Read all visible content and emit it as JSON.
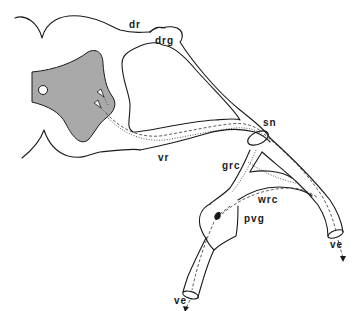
{
  "diagram": {
    "type": "anatomical-schematic",
    "colors": {
      "line": "#1a1a1a",
      "gray_matter": "#a9a9a9",
      "background": "#ffffff"
    },
    "labels": {
      "dr": "dr",
      "drg": "drg",
      "vr": "vr",
      "sn": "sn",
      "grc": "grc",
      "wrc": "wrc",
      "pvg": "pvg",
      "ve_left": "ve",
      "ve_right": "ve"
    }
  }
}
